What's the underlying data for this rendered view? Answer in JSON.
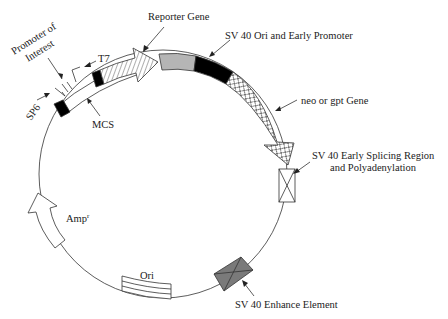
{
  "diagram": {
    "type": "plasmid-map",
    "colors": {
      "line": "#333333",
      "promoter_fill": "#000000",
      "reporter_fill": "#ffffff",
      "sv40_ori_gray": "#b5b5b5",
      "enhancer_fill": "#7a7a7a",
      "background": "#ffffff"
    },
    "labels": {
      "promoter_of_interest_line1": "Promoter of",
      "promoter_of_interest_line2": "Interest",
      "t7": "T7",
      "sp6": "SP6",
      "mcs": "MCS",
      "reporter_gene": "Reporter Gene",
      "sv40_ori_promoter": "SV 40 Ori and Early Promoter",
      "neo_gpt_gene": "neo or gpt Gene",
      "sv40_splicing_line1": "SV 40 Early Splicing Region",
      "sv40_splicing_line2": "and Polyadenylation",
      "sv40_enhancer": "SV 40 Enhance Element",
      "amp": "Amp",
      "amp_superscript": "r",
      "ori": "Ori"
    }
  }
}
